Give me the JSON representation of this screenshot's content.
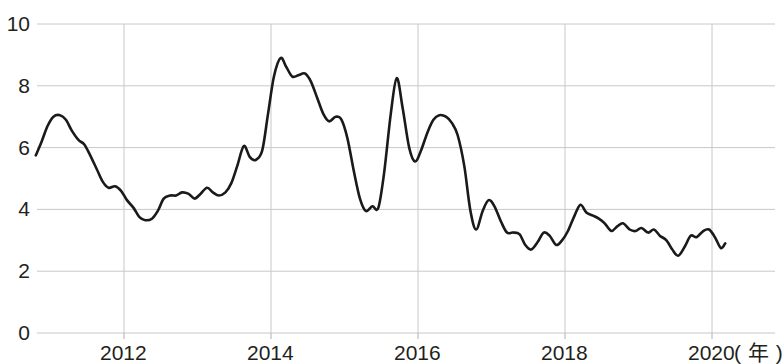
{
  "chart_data": {
    "type": "line",
    "title": "",
    "subtitle": "",
    "xlabel": "( 年 )",
    "ylabel": "",
    "xlim": [
      2010.75,
      2020.2
    ],
    "ylim": [
      0,
      10
    ],
    "grid": true,
    "legend": null,
    "legend_position": "none",
    "line_color": "#1a1a1a",
    "grid_color": "#c8c8cc",
    "axis_color": "#b0b0b4",
    "y_ticks": [
      "0",
      "2",
      "4",
      "6",
      "8",
      "10"
    ],
    "y_tick_values": [
      0,
      2,
      4,
      6,
      8,
      10
    ],
    "x_ticks": [
      "2012",
      "2014",
      "2016",
      "2018",
      "2020"
    ],
    "x_tick_values": [
      2012,
      2014,
      2016,
      2018,
      2020
    ],
    "x_axis_unit": "( 年 )",
    "series": [
      {
        "name": "series-1",
        "color": "#1a1a1a",
        "x": [
          2010.8,
          2010.88,
          2010.96,
          2011.04,
          2011.13,
          2011.21,
          2011.29,
          2011.38,
          2011.46,
          2011.54,
          2011.63,
          2011.71,
          2011.79,
          2011.88,
          2011.96,
          2012.04,
          2012.13,
          2012.21,
          2012.29,
          2012.38,
          2012.46,
          2012.54,
          2012.63,
          2012.71,
          2012.79,
          2012.88,
          2012.96,
          2013.04,
          2013.13,
          2013.21,
          2013.29,
          2013.38,
          2013.46,
          2013.54,
          2013.63,
          2013.71,
          2013.79,
          2013.88,
          2013.96,
          2014.04,
          2014.13,
          2014.21,
          2014.29,
          2014.38,
          2014.46,
          2014.54,
          2014.63,
          2014.71,
          2014.79,
          2014.88,
          2014.96,
          2015.04,
          2015.13,
          2015.21,
          2015.29,
          2015.38,
          2015.46,
          2015.54,
          2015.63,
          2015.71,
          2015.79,
          2015.88,
          2015.96,
          2016.04,
          2016.13,
          2016.21,
          2016.29,
          2016.38,
          2016.46,
          2016.54,
          2016.63,
          2016.71,
          2016.79,
          2016.88,
          2016.96,
          2017.04,
          2017.13,
          2017.21,
          2017.29,
          2017.38,
          2017.46,
          2017.54,
          2017.63,
          2017.71,
          2017.79,
          2017.88,
          2017.96,
          2018.04,
          2018.13,
          2018.21,
          2018.29,
          2018.38,
          2018.46,
          2018.54,
          2018.63,
          2018.71,
          2018.79,
          2018.88,
          2018.96,
          2019.04,
          2019.13,
          2019.21,
          2019.29,
          2019.38,
          2019.46,
          2019.54,
          2019.63,
          2019.71,
          2019.79,
          2019.88,
          2019.96,
          2020.04,
          2020.12,
          2020.18
        ],
        "values": [
          5.75,
          6.2,
          6.7,
          7.0,
          7.05,
          6.9,
          6.55,
          6.25,
          6.1,
          5.75,
          5.3,
          4.9,
          4.7,
          4.75,
          4.6,
          4.3,
          4.05,
          3.75,
          3.65,
          3.7,
          3.95,
          4.35,
          4.45,
          4.45,
          4.55,
          4.5,
          4.35,
          4.5,
          4.7,
          4.55,
          4.45,
          4.55,
          4.85,
          5.4,
          6.05,
          5.7,
          5.6,
          5.9,
          7.1,
          8.3,
          8.9,
          8.6,
          8.3,
          8.35,
          8.4,
          8.15,
          7.6,
          7.1,
          6.85,
          7.0,
          6.9,
          6.3,
          5.2,
          4.35,
          3.95,
          4.1,
          4.05,
          5.2,
          7.1,
          8.25,
          7.3,
          6.0,
          5.55,
          5.9,
          6.5,
          6.9,
          7.05,
          7.0,
          6.8,
          6.4,
          5.4,
          4.0,
          3.35,
          3.95,
          4.3,
          4.1,
          3.6,
          3.25,
          3.25,
          3.2,
          2.85,
          2.7,
          2.95,
          3.25,
          3.15,
          2.85,
          3.0,
          3.3,
          3.8,
          4.15,
          3.9,
          3.8,
          3.7,
          3.55,
          3.3,
          3.45,
          3.55,
          3.35,
          3.3,
          3.4,
          3.25,
          3.35,
          3.15,
          3.0,
          2.7,
          2.5,
          2.8,
          3.15,
          3.1,
          3.3,
          3.35,
          3.1,
          2.75,
          2.9
        ]
      }
    ]
  },
  "axes": {
    "y_labels": [
      {
        "text": "10",
        "value": 10
      },
      {
        "text": "8",
        "value": 8
      },
      {
        "text": "6",
        "value": 6
      },
      {
        "text": "4",
        "value": 4
      },
      {
        "text": "2",
        "value": 2
      },
      {
        "text": "0",
        "value": 0
      }
    ],
    "x_labels": [
      {
        "text": "2012",
        "value": 2012
      },
      {
        "text": "2014",
        "value": 2014
      },
      {
        "text": "2016",
        "value": 2016
      },
      {
        "text": "2018",
        "value": 2018
      },
      {
        "text": "2020",
        "value": 2020
      }
    ],
    "x_unit_label": "( 年 )"
  }
}
